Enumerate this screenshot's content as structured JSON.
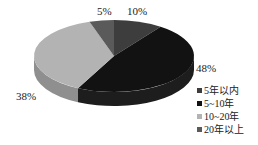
{
  "chart_data": {
    "type": "pie",
    "title": "",
    "style": "3d",
    "categories": [
      "5年以内",
      "5~10年",
      "10~20年",
      "20年以上"
    ],
    "values": [
      10,
      48,
      38,
      5
    ],
    "labels": [
      "10%",
      "48%",
      "38%",
      "5%"
    ],
    "colors": [
      "#3d3d3d",
      "#121212",
      "#b3b3b3",
      "#5a5a5a"
    ],
    "legend_position": "right-bottom"
  },
  "legend": {
    "items": [
      {
        "label": "5年以内",
        "color": "#3d3d3d"
      },
      {
        "label": "5~10年",
        "color": "#121212"
      },
      {
        "label": "10~20年",
        "color": "#b3b3b3"
      },
      {
        "label": "20年以上",
        "color": "#5a5a5a"
      }
    ]
  },
  "data_labels": {
    "a": "10%",
    "b": "48%",
    "c": "38%",
    "d": "5%"
  }
}
